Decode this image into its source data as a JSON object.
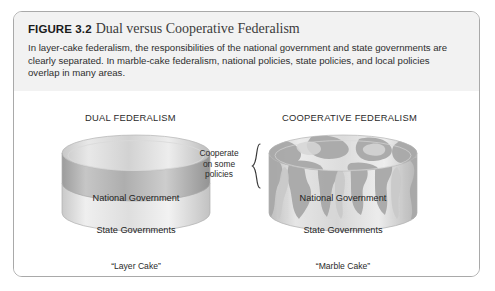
{
  "figure": {
    "label": "FIGURE 3.2",
    "name": "Dual versus Cooperative Federalism",
    "description": "In layer-cake federalism, the responsibilities of the national government and state governments are clearly separated. In marble-cake federalism, national policies, state policies, and local policies overlap in many areas."
  },
  "panels": [
    {
      "heading": "DUAL FEDERALISM",
      "layers": [
        {
          "label": "National Government"
        },
        {
          "label": "State Governments"
        }
      ],
      "caption": "“Layer Cake”"
    },
    {
      "heading": "COOPERATIVE FEDERALISM",
      "layers": [
        {
          "label": "National Government"
        },
        {
          "label": "State Governments"
        }
      ],
      "caption": "“Marble Cake”"
    }
  ],
  "annotation": {
    "line1": "Cooperate",
    "line2": "on some",
    "line3": "policies"
  },
  "colors": {
    "border": "#a9a9a9",
    "header_background": "#f2f2f2",
    "cake_light": "#e4e4e4",
    "cake_mid": "#bdbdbd",
    "cake_dark": "#9e9e9e",
    "text": "#1d1d1d"
  }
}
